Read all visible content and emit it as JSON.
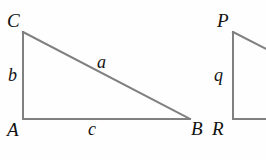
{
  "figure": {
    "background_color": "#fefefe",
    "stroke_color": "#808080",
    "label_color": "#111111",
    "stroke_width": 2,
    "width": 266,
    "height": 160
  },
  "triangles": [
    {
      "name": "triangle-ABC",
      "vertices": {
        "C": {
          "label": "C",
          "x": 23,
          "y": 32
        },
        "A": {
          "label": "A",
          "x": 23,
          "y": 119
        },
        "B": {
          "label": "B",
          "x": 190,
          "y": 119
        }
      },
      "sides": {
        "b": {
          "label": "b",
          "from": "A",
          "to": "C"
        },
        "c": {
          "label": "c",
          "from": "A",
          "to": "B"
        },
        "a": {
          "label": "a",
          "from": "C",
          "to": "B"
        }
      },
      "right_angle_at": "A"
    },
    {
      "name": "triangle-PQR",
      "clipped": true,
      "vertices": {
        "P": {
          "label": "P",
          "x": 233,
          "y": 32
        },
        "R": {
          "label": "R",
          "x": 233,
          "y": 119
        }
      },
      "sides": {
        "q": {
          "label": "q",
          "from": "R",
          "to": "P"
        }
      },
      "right_angle_at": "R"
    }
  ],
  "labels": {
    "C": "C",
    "A": "A",
    "B": "B",
    "b": "b",
    "a": "a",
    "c": "c",
    "P": "P",
    "R": "R",
    "q": "q"
  }
}
